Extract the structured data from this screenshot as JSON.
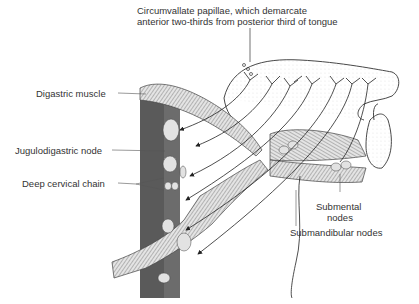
{
  "diagram": {
    "labels": {
      "circumvallate_line1": "Circumvallate papillae, which demarcate",
      "circumvallate_line2": "anterior two-thirds from posterior third of tongue",
      "digastric_muscle": "Digastric muscle",
      "jugulodigastric_node": "Jugulodigastric node",
      "deep_cervical_chain": "Deep cervical chain",
      "submental_line1": "Submental",
      "submental_line2": "nodes",
      "submandibular_nodes": "Submandibular nodes"
    },
    "colors": {
      "ink": "#2a2a2a",
      "jugular_vein": "#5a5a5a",
      "muscle_fill": "#d8d8d8",
      "node_fill": "#e2e2e2",
      "background": "#ffffff"
    }
  }
}
